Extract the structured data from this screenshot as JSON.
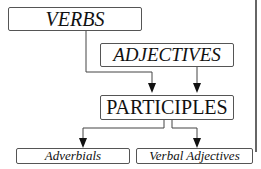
{
  "diagram": {
    "nodes": {
      "verbs": "VERBS",
      "adjectives": "ADJECTIVES",
      "participles": "PARTICIPLES",
      "adverbials": "Adverbials",
      "verbal_adjectives": "Verbal Adjectives"
    },
    "edges": [
      {
        "from": "VERBS",
        "to": "PARTICIPLES"
      },
      {
        "from": "ADJECTIVES",
        "to": "PARTICIPLES"
      },
      {
        "from": "PARTICIPLES",
        "to": "Adverbials"
      },
      {
        "from": "PARTICIPLES",
        "to": "Verbal Adjectives"
      }
    ]
  }
}
